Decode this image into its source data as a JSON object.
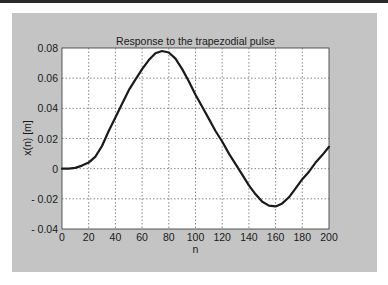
{
  "chart_data": {
    "type": "line",
    "title": "Response to the trapezodial pulse",
    "xlabel": "n",
    "ylabel": "x(n) [m]",
    "xlim": [
      0,
      200
    ],
    "ylim": [
      -0.04,
      0.08
    ],
    "grid": true,
    "legend": null,
    "x_ticks": [
      0,
      20,
      40,
      60,
      80,
      100,
      120,
      140,
      160,
      180,
      200
    ],
    "y_ticks": [
      -0.04,
      -0.02,
      0,
      0.02,
      0.04,
      0.06,
      0.08
    ],
    "x_tick_labels": [
      "0",
      "20",
      "40",
      "60",
      "80",
      "100",
      "120",
      "140",
      "160",
      "180",
      "200"
    ],
    "y_tick_labels": [
      "- 0.04",
      "- 0.02",
      "0",
      "0.02",
      "0.04",
      "0.06",
      "0.08"
    ],
    "series": [
      {
        "name": "x(n)",
        "color": "#1a1a1a",
        "x": [
          0,
          5,
          10,
          15,
          20,
          25,
          30,
          35,
          40,
          45,
          50,
          55,
          60,
          65,
          70,
          75,
          80,
          85,
          90,
          95,
          100,
          105,
          110,
          115,
          120,
          125,
          130,
          135,
          140,
          145,
          150,
          155,
          160,
          165,
          170,
          175,
          180,
          185,
          190,
          195,
          200
        ],
        "values": [
          0,
          0,
          0.0005,
          0.002,
          0.004,
          0.008,
          0.015,
          0.025,
          0.034,
          0.043,
          0.052,
          0.059,
          0.066,
          0.072,
          0.0765,
          0.078,
          0.077,
          0.073,
          0.066,
          0.058,
          0.049,
          0.041,
          0.033,
          0.025,
          0.018,
          0.01,
          0.003,
          -0.004,
          -0.011,
          -0.017,
          -0.022,
          -0.0245,
          -0.025,
          -0.023,
          -0.019,
          -0.013,
          -0.007,
          -0.002,
          0.004,
          0.009,
          0.0145
        ]
      }
    ]
  },
  "colors": {
    "figure_background": "#c4c4c4",
    "plot_background": "#ffffff",
    "grid": "#555555",
    "line": "#1a1a1a"
  }
}
